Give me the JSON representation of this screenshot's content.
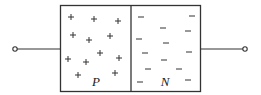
{
  "diagram": {
    "type": "pn-junction",
    "colors": {
      "stroke": "#333333",
      "background": "#ffffff"
    },
    "regions": {
      "p": {
        "label": "P",
        "carrier_symbol": "+",
        "carriers": [
          [
            71,
            17
          ],
          [
            94,
            19
          ],
          [
            118,
            21
          ],
          [
            73,
            35
          ],
          [
            89,
            40
          ],
          [
            110,
            36
          ],
          [
            68,
            59
          ],
          [
            86,
            62
          ],
          [
            100,
            53
          ],
          [
            119,
            58
          ],
          [
            78,
            75
          ],
          [
            115,
            73
          ]
        ]
      },
      "n": {
        "label": "N",
        "carrier_symbol": "−",
        "carriers": [
          [
            141,
            17
          ],
          [
            163,
            28
          ],
          [
            192,
            16
          ],
          [
            188,
            31
          ],
          [
            139,
            39
          ],
          [
            166,
            43
          ],
          [
            145,
            53
          ],
          [
            189,
            52
          ],
          [
            164,
            60
          ],
          [
            148,
            69
          ],
          [
            179,
            69
          ],
          [
            140,
            82
          ],
          [
            188,
            80
          ]
        ]
      }
    },
    "terminals": {
      "left": {
        "name": "anode-terminal"
      },
      "right": {
        "name": "cathode-terminal"
      }
    }
  }
}
